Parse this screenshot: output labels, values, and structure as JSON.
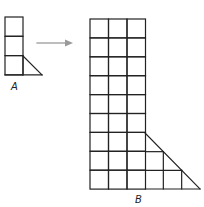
{
  "figure": {
    "shape_a": {
      "label": "A",
      "origin": [
        5,
        17
      ],
      "cell_w": 18,
      "cell_h": 19.3,
      "columns": 1,
      "rows": 3,
      "extra_bottom_squares": 1,
      "triangle": {
        "from": [
          23,
          56
        ],
        "to": [
          42,
          75
        ]
      }
    },
    "arrow": {
      "x1": 37,
      "y1": 43,
      "x2": 73,
      "y2": 43,
      "color": "#9a9a9a"
    },
    "shape_b": {
      "label": "B",
      "origin": [
        90,
        19
      ],
      "cell_w": 18.5,
      "cell_h": 18.9,
      "columns": 3,
      "rows": 9,
      "triangle": {
        "from": [
          145,
          133
        ],
        "to": [
          200,
          189
        ]
      }
    },
    "line_color": "#222222"
  }
}
